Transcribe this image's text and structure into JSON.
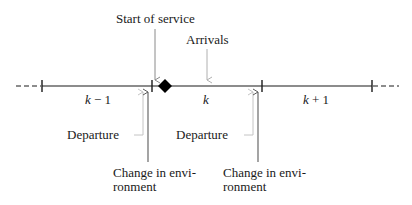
{
  "diagram": {
    "segments": [
      {
        "label": "k − 1",
        "italic_var": "k",
        "suffix": " − 1"
      },
      {
        "label": "k",
        "italic_var": "k",
        "suffix": ""
      },
      {
        "label": "k + 1",
        "italic_var": "k",
        "suffix": " + 1"
      }
    ],
    "annotations": {
      "start_of_service": "Start of service",
      "arrivals": "Arrivals",
      "departure_left": "Departure",
      "departure_right": "Departure",
      "change_env_left_line1": "Change in envi-",
      "change_env_left_line2": "ronment",
      "change_env_right_line1": "Change in envi-",
      "change_env_right_line2": "ronment"
    },
    "marker": "diamond",
    "colors": {
      "line": "#1a1a1a",
      "start_of_service_arrow": "#8a8a8a",
      "arrivals_arrow": "#b0b0b0",
      "departure_arrow": "#c4c4c4",
      "change_env_arrow": "#5a5a5a"
    }
  }
}
